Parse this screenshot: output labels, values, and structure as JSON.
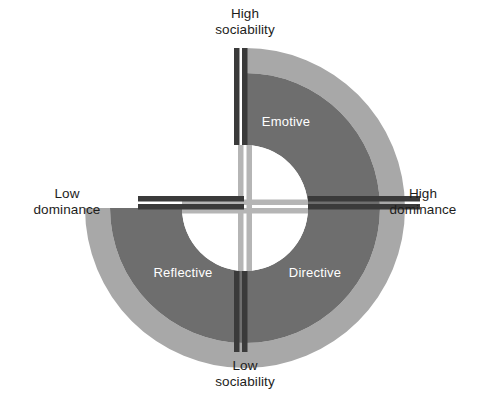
{
  "figure": {
    "type": "quadrant-wheel-diagram",
    "background_color": "#ffffff"
  },
  "axes": {
    "vertical": {
      "name": "sociability",
      "top_label_line1": "High",
      "top_label_line2": "sociability",
      "bottom_label_line1": "Low",
      "bottom_label_line2": "sociability"
    },
    "horizontal": {
      "name": "dominance",
      "left_label_line1": "Low",
      "left_label_line2": "dominance",
      "right_label_line1": "High",
      "right_label_line2": "dominance"
    }
  },
  "quadrants": [
    {
      "id": "emotive",
      "label": "Emotive",
      "position": "top-right",
      "sociability": "High",
      "dominance": "High",
      "fill": "#6e6e6e",
      "outer_ring": true
    },
    {
      "id": "directive",
      "label": "Directive",
      "position": "bottom-right",
      "sociability": "Low",
      "dominance": "High",
      "fill": "#6e6e6e",
      "outer_ring": true
    },
    {
      "id": "reflective",
      "label": "Reflective",
      "position": "bottom-left",
      "sociability": "Low",
      "dominance": "Low",
      "fill": "#6e6e6e",
      "outer_ring": true
    },
    {
      "id": "supportive-empty",
      "label": "",
      "position": "top-left",
      "sociability": "High",
      "dominance": "Low",
      "fill": "#ffffff",
      "outer_ring": false
    }
  ],
  "colors": {
    "ring_dark": "#6e6e6e",
    "ring_light": "#a8a8a8",
    "axis_bar_dark": "#3a3a3a",
    "axis_bar_light": "#b5b5b5",
    "center_fill": "#ffffff",
    "label_text": "#1d1d1b",
    "quadrant_text": "#ffffff"
  },
  "geometry": {
    "center_x": 245,
    "center_y": 208,
    "outer_radius": 160,
    "mid_radius": 135,
    "inner_radius": 63
  }
}
